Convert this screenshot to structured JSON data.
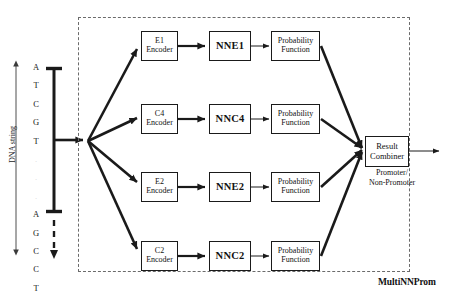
{
  "figure": {
    "system_name": "MultiNNProm",
    "input": {
      "axis_label": "DNA string",
      "bases": [
        "A",
        "T",
        "C",
        "G",
        "T",
        ".",
        ".",
        ".",
        "A",
        "G",
        "C",
        "C",
        "T"
      ],
      "faint_indices": [
        5,
        6,
        7
      ]
    },
    "output": {
      "label_line1": "Promoter/",
      "label_line2": "Non-Promoter"
    },
    "combiner": {
      "line1": "Result",
      "line2": "Combiner"
    },
    "branches": [
      {
        "encoder_line1": "E1",
        "encoder_line2": "Encoder",
        "network": "NNE1",
        "probability_line1": "Probability",
        "probability_line2": "Function"
      },
      {
        "encoder_line1": "C4",
        "encoder_line2": "Encoder",
        "network": "NNC4",
        "probability_line1": "Probability",
        "probability_line2": "Function"
      },
      {
        "encoder_line1": "E2",
        "encoder_line2": "Encoder",
        "network": "NNE2",
        "probability_line1": "Probability",
        "probability_line2": "Function"
      },
      {
        "encoder_line1": "C2",
        "encoder_line2": "Encoder",
        "network": "NNC2",
        "probability_line1": "Probability",
        "probability_line2": "Function"
      }
    ],
    "colors": {
      "stroke": "#1a1a1a",
      "dashed_border": "#6b6b6b",
      "background": "#ffffff",
      "faint_text": "#d8d8d8"
    }
  }
}
